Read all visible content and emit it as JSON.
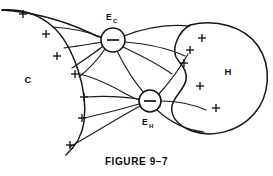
{
  "figure": {
    "caption": "FIGURE 9–7",
    "background_color": "#ffffff",
    "ink_color": "#141414",
    "width": 273,
    "height": 176
  },
  "diagram": {
    "type": "schematic-field-diagram",
    "regions": [
      {
        "id": "C",
        "label": "C",
        "label_x": 28,
        "label_y": 80,
        "shape": "open-leaf-boundary-left"
      },
      {
        "id": "H",
        "label": "H",
        "label_x": 228,
        "label_y": 72,
        "shape": "large-blob-right-with-left-notch"
      }
    ],
    "nodes": [
      {
        "id": "Ec",
        "label_main": "E",
        "label_sub": "C",
        "sign": "−",
        "cx": 113,
        "cy": 40,
        "r": 12,
        "label_position": "above"
      },
      {
        "id": "EH",
        "label_main": "E",
        "label_sub": "H",
        "sign": "−",
        "cx": 150,
        "cy": 101,
        "r": 11,
        "label_position": "below"
      }
    ],
    "plus_marks": [
      {
        "id": "c-plus-1",
        "x": 23,
        "y": 14,
        "region": "C"
      },
      {
        "id": "c-plus-2",
        "x": 46,
        "y": 34,
        "region": "C"
      },
      {
        "id": "c-plus-3",
        "x": 57,
        "y": 56,
        "region": "C"
      },
      {
        "id": "c-plus-4",
        "x": 75,
        "y": 74,
        "region": "C"
      },
      {
        "id": "c-plus-5",
        "x": 84,
        "y": 97,
        "region": "C"
      },
      {
        "id": "c-plus-6",
        "x": 82,
        "y": 118,
        "region": "C"
      },
      {
        "id": "c-plus-7",
        "x": 70,
        "y": 145,
        "region": "C"
      },
      {
        "id": "h-plus-1",
        "x": 202,
        "y": 38,
        "region": "H"
      },
      {
        "id": "h-plus-2",
        "x": 190,
        "y": 50,
        "region": "H"
      },
      {
        "id": "h-plus-3",
        "x": 184,
        "y": 63,
        "region": "H"
      },
      {
        "id": "h-plus-4",
        "x": 200,
        "y": 86,
        "region": "H"
      },
      {
        "id": "h-plus-5",
        "x": 216,
        "y": 108,
        "region": "H"
      }
    ],
    "plus_count_C": 7,
    "plus_count_H": 5,
    "node_count": 2
  }
}
